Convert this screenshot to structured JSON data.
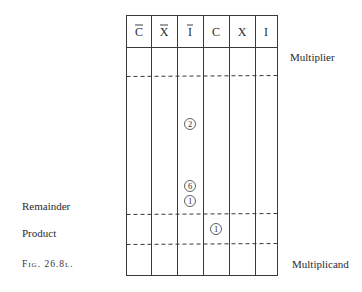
{
  "figure": {
    "caption": "Fig. 26.8l.",
    "columns": [
      {
        "label": "C",
        "overline": true
      },
      {
        "label": "X",
        "overline": true
      },
      {
        "label": "I",
        "overline": true
      },
      {
        "label": "C",
        "overline": false
      },
      {
        "label": "X",
        "overline": false
      },
      {
        "label": "I",
        "overline": false
      }
    ],
    "right_labels": {
      "multiplier": "Multiplier",
      "multiplicand": "Multiplicand"
    },
    "left_labels": {
      "remainder": "Remainder",
      "product": "Product"
    },
    "markers": [
      {
        "value": "2",
        "column": 2,
        "row_region": "remainder"
      },
      {
        "value": "6",
        "column": 2,
        "row_region": "remainder"
      },
      {
        "value": "1",
        "column": 2,
        "row_region": "remainder"
      },
      {
        "value": "1",
        "column": 3,
        "row_region": "product"
      }
    ]
  }
}
